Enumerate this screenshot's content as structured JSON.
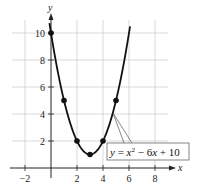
{
  "chart_data": {
    "type": "line",
    "title": "",
    "xlabel": "x",
    "ylabel": "y",
    "xlim": [
      -3,
      9
    ],
    "ylim": [
      0,
      11
    ],
    "grid": true,
    "x_ticks": [
      -2,
      2,
      4,
      6,
      8
    ],
    "y_ticks": [
      2,
      4,
      6,
      8,
      10
    ],
    "x_tick_labels": [
      "−2",
      "2",
      "4",
      "6",
      "8"
    ],
    "y_tick_labels": [
      "2",
      "4",
      "6",
      "8",
      "10"
    ],
    "series": [
      {
        "name": "y = x² − 6x + 10",
        "function": "x^2 - 6x + 10",
        "points": [
          {
            "x": 0,
            "y": 10
          },
          {
            "x": 1,
            "y": 5
          },
          {
            "x": 2,
            "y": 2
          },
          {
            "x": 3,
            "y": 1
          },
          {
            "x": 4,
            "y": 2
          },
          {
            "x": 5,
            "y": 5
          }
        ]
      }
    ],
    "annotations": [
      {
        "text": "y = x² − 6x + 10",
        "pointer_to": "curve"
      }
    ],
    "legend": {
      "position": "none"
    }
  },
  "labels": {
    "x_axis": "x",
    "y_axis": "y",
    "equation_y": "y",
    "equation_eq": " = ",
    "equation_x": "x",
    "equation_exp": "2",
    "equation_rest_minus": " − 6",
    "equation_rest_x": "x",
    "equation_rest_plus": " + 10"
  }
}
